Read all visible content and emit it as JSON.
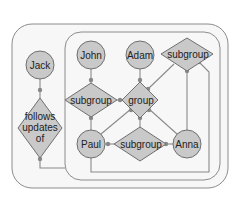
{
  "diagram": {
    "type": "graph",
    "frames": [
      {
        "id": "outer",
        "label": ""
      },
      {
        "id": "inner",
        "label": ""
      }
    ],
    "nodes": {
      "jack": {
        "label": "Jack",
        "shape": "circle"
      },
      "follows": {
        "label_lines": [
          "follows",
          "updates",
          "of"
        ],
        "shape": "diamond"
      },
      "john": {
        "label": "John",
        "shape": "circle"
      },
      "adam": {
        "label": "Adam",
        "shape": "circle"
      },
      "subgroup_top": {
        "label": "subgroup",
        "shape": "diamond"
      },
      "subgroup_left": {
        "label": "subgroup",
        "shape": "diamond"
      },
      "group": {
        "label": "group",
        "shape": "diamond"
      },
      "paul": {
        "label": "Paul",
        "shape": "circle"
      },
      "subgroup_bottom": {
        "label": "subgroup",
        "shape": "diamond"
      },
      "anna": {
        "label": "Anna",
        "shape": "circle"
      }
    },
    "edges": [
      {
        "from": "Jack",
        "to": "follows updates of"
      },
      {
        "from": "follows updates of",
        "to": "inner frame"
      },
      {
        "from": "John",
        "to": "subgroup (left)"
      },
      {
        "from": "subgroup (left)",
        "to": "Paul"
      },
      {
        "from": "Adam",
        "to": "group"
      },
      {
        "from": "subgroup (left)",
        "to": "group"
      },
      {
        "from": "subgroup (top)",
        "to": "group"
      },
      {
        "from": "group",
        "to": "Paul"
      },
      {
        "from": "group",
        "to": "subgroup (bottom)"
      },
      {
        "from": "group",
        "to": "Anna"
      },
      {
        "from": "Paul",
        "to": "subgroup (bottom)"
      },
      {
        "from": "subgroup (bottom)",
        "to": "Anna"
      },
      {
        "from": "subgroup (top)",
        "to": "Anna"
      },
      {
        "from": "subgroup (top)",
        "to": "Paul (enclosing loop)"
      }
    ],
    "colors": {
      "node_fill": "#c9c9c9",
      "node_stroke": "#6f6f6f",
      "edge": "#8a8a8a",
      "frame_stroke": "#8c8c8c",
      "background": "#f7f7f7"
    }
  }
}
